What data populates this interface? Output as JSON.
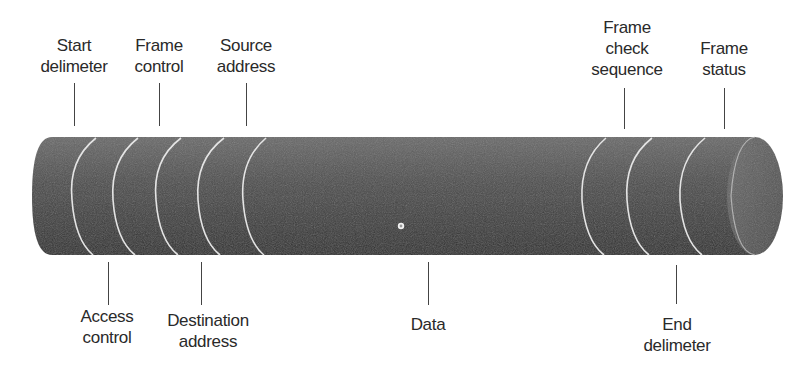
{
  "diagram": {
    "top_labels": [
      {
        "id": "start-delimeter",
        "text": "Start\ndelimeter",
        "x": 74
      },
      {
        "id": "frame-control",
        "text": "Frame\ncontrol",
        "x": 159
      },
      {
        "id": "source-address",
        "text": "Source\naddress",
        "x": 246
      },
      {
        "id": "frame-check-sequence",
        "text": "Frame\ncheck\nsequence",
        "x": 624
      },
      {
        "id": "frame-status",
        "text": "Frame\nstatus",
        "x": 724
      }
    ],
    "bottom_labels": [
      {
        "id": "access-control",
        "text": "Access\ncontrol",
        "x": 108
      },
      {
        "id": "destination-address",
        "text": "Destination\naddress",
        "x": 201
      },
      {
        "id": "data",
        "text": "Data",
        "x": 428
      },
      {
        "id": "end-delimeter",
        "text": "End\ndelimeter",
        "x": 676
      }
    ],
    "colors": {
      "cylinder_dark": "#3a3a3a",
      "cylinder_light": "#6a6a6a",
      "separator": "#e6e6e6",
      "text": "#2a2a2a"
    }
  }
}
